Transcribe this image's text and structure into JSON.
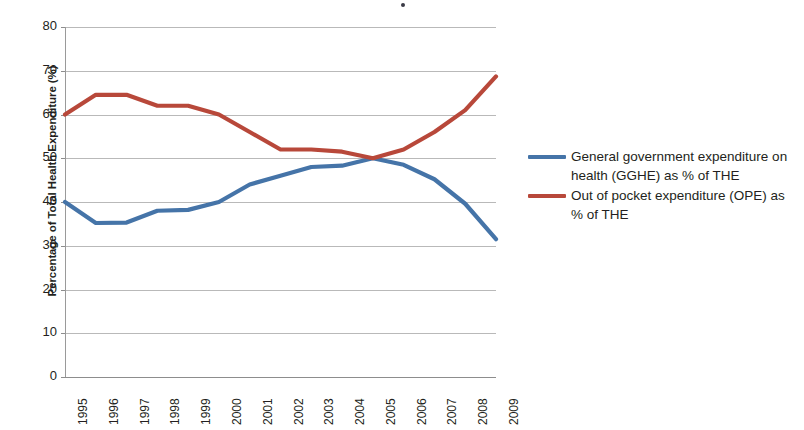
{
  "chart_data": {
    "type": "line",
    "title": "",
    "subtitle": "",
    "xlabel": "",
    "ylabel": "Percentage of Total Health Expenditure (%)",
    "categories": [
      "1995",
      "1996",
      "1997",
      "1998",
      "1999",
      "2000",
      "2001",
      "2002",
      "2003",
      "2004",
      "2005",
      "2006",
      "2007",
      "2008",
      "2009"
    ],
    "x": [
      1995,
      1996,
      1997,
      1998,
      1999,
      2000,
      2001,
      2002,
      2003,
      2004,
      2005,
      2006,
      2007,
      2008,
      2009
    ],
    "xlim": [
      1995,
      2009
    ],
    "ylim": [
      0,
      80
    ],
    "yticks": [
      0,
      10,
      20,
      30,
      40,
      50,
      60,
      70,
      80
    ],
    "grid": "horizontal",
    "legend_position": "right",
    "series": [
      {
        "name": "General government expenditure on health (GGHE) as % of THE",
        "color": "#4574a8",
        "values": [
          40.0,
          35.2,
          35.3,
          38.0,
          38.2,
          40.0,
          44.0,
          46.0,
          48.0,
          48.3,
          50.0,
          48.5,
          45.2,
          39.6,
          31.5
        ]
      },
      {
        "name": "Out of pocket expenditure (OPE) as % of THE",
        "color": "#b8483a",
        "values": [
          60.0,
          64.5,
          64.5,
          62.0,
          62.0,
          60.0,
          56.0,
          52.0,
          52.0,
          51.5,
          50.0,
          52.0,
          56.0,
          61.0,
          68.7
        ]
      }
    ]
  },
  "axis": {
    "y_title": "Percentage of Total Health Expenditure (%)",
    "y_ticks": [
      "80",
      "70",
      "60",
      "50",
      "40",
      "30",
      "20",
      "10",
      "0"
    ],
    "x_ticks": [
      "1995",
      "1996",
      "1997",
      "1998",
      "1999",
      "2000",
      "2001",
      "2002",
      "2003",
      "2004",
      "2005",
      "2006",
      "2007",
      "2008",
      "2009"
    ]
  },
  "legend": {
    "items": [
      {
        "label": "General government expenditure on health (GGHE) as % of THE",
        "color": "#4574a8"
      },
      {
        "label": "Out of pocket expenditure (OPE) as % of THE",
        "color": "#b8483a"
      }
    ]
  },
  "colors": {
    "series_blue": "#4574a8",
    "series_red": "#b8483a",
    "gridline": "#b9b9b9",
    "axis": "#8d8d8d",
    "text": "#231f20",
    "background": "#ffffff"
  }
}
